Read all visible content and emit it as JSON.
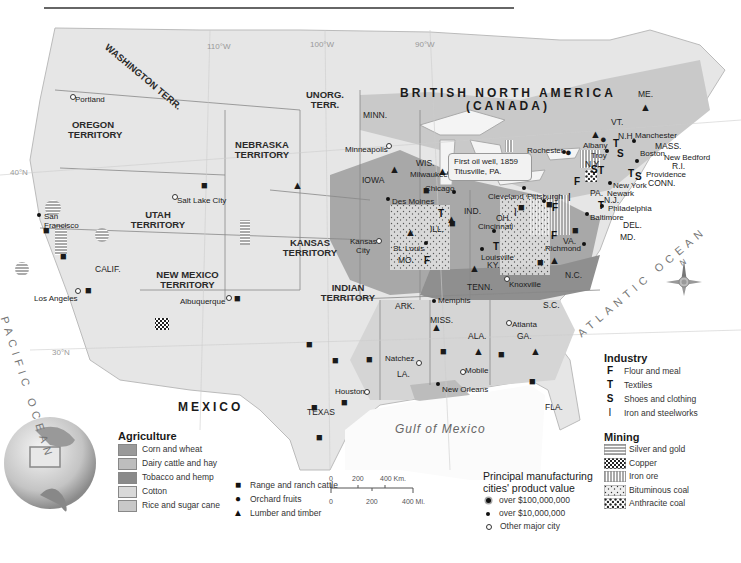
{
  "map": {
    "countries": {
      "canada_line1": "BRITISH NORTH AMERICA",
      "canada_line2": "(CANADA)",
      "mexico": "MEXICO"
    },
    "oceans": {
      "pacific": "PACIFIC OCEAN",
      "atlantic": "ATLANTIC OCEAN",
      "gulf": "Gulf of Mexico"
    },
    "graticule": {
      "lon_110": "110°W",
      "lon_100": "100°W",
      "lon_90": "90°W",
      "lat_40": "40°N",
      "lat_30": "30°N"
    },
    "territories": {
      "washington": "WASHINGTON TERR.",
      "oregon": "OREGON TERRITORY",
      "utah": "UTAH TERRITORY",
      "new_mexico": "NEW MEXICO TERRITORY",
      "nebraska": "NEBRASKA TERRITORY",
      "kansas": "KANSAS TERRITORY",
      "indian": "INDIAN TERRITORY",
      "unorg": "UNORG. TERR."
    },
    "states": {
      "calif": "CALIF.",
      "texas": "TEXAS",
      "minn": "MINN.",
      "iowa": "IOWA",
      "wis": "WIS.",
      "mich": "MICH.",
      "ill": "ILL.",
      "ind": "IND.",
      "oh": "OH.",
      "mo": "MO.",
      "ky": "KY.",
      "tenn": "TENN.",
      "ark": "ARK.",
      "la": "LA.",
      "miss": "MISS.",
      "ala": "ALA.",
      "ga": "GA.",
      "fla": "FLA.",
      "sc": "S.C.",
      "nc": "N.C.",
      "va": "VA.",
      "pa": "PA.",
      "ny": "N.Y.",
      "nj": "N.J.",
      "del": "DEL.",
      "md": "MD.",
      "conn": "CONN.",
      "ri": "R.I.",
      "mass": "MASS.",
      "nh": "N.H.",
      "vt": "VT.",
      "me": "ME."
    },
    "cities": {
      "portland": "Portland",
      "san_francisco": "San Francisco",
      "los_angeles": "Los Angeles",
      "salt_lake_city": "Salt Lake City",
      "albuquerque": "Albuquerque",
      "minneapolis": "Minneapolis",
      "milwaukee": "Milwaukee",
      "chicago": "Chicago",
      "des_moines": "Des Moines",
      "kansas_city": "Kansas City",
      "st_louis": "St. Louis",
      "detroit": "Detroit",
      "cleveland": "Cleveland",
      "pittsburgh": "Pittsburgh",
      "cincinnati": "Cincinnati",
      "louisville": "Louisville",
      "knoxville": "Knoxville",
      "memphis": "Memphis",
      "atlanta": "Atlanta",
      "natchez": "Natchez",
      "mobile": "Mobile",
      "new_orleans": "New Orleans",
      "houston": "Houston",
      "rochester": "Rochester",
      "albany": "Albany",
      "troy": "Troy",
      "manchester": "Manchester",
      "boston": "Boston",
      "new_bedford": "New Bedford",
      "providence": "Providence",
      "new_york": "New York",
      "newark": "Newark",
      "philadelphia": "Philadelphia",
      "baltimore": "Baltimore",
      "richmond": "Richmond"
    },
    "callout": {
      "line1": "First oil well, 1859",
      "line2": "Titusville, PA."
    },
    "compass": "N"
  },
  "legend": {
    "agriculture": {
      "title": "Agriculture",
      "items": [
        {
          "label": "Corn and wheat",
          "color": "#9a9a9a"
        },
        {
          "label": "Dairy cattle and hay",
          "color": "#bdbdbd"
        },
        {
          "label": "Tobacco and hemp",
          "color": "#8a8a8a"
        },
        {
          "label": "Cotton",
          "color": "#d9d9d9"
        },
        {
          "label": "Rice and sugar cane",
          "color": "#c8c8c8"
        }
      ],
      "symbols": [
        {
          "icon": "cattle-icon",
          "label": "Range and ranch cattle"
        },
        {
          "icon": "orchard-icon",
          "label": "Orchard fruits"
        },
        {
          "icon": "tree-icon",
          "label": "Lumber and timber"
        }
      ]
    },
    "scale": {
      "km": [
        "0",
        "200",
        "400 Km."
      ],
      "mi": [
        "0",
        "200",
        "400 Mi."
      ]
    },
    "manufacturing": {
      "title_line1": "Principal manufacturing",
      "title_line2": "cities' product value",
      "items": [
        {
          "symbol": "large-dot",
          "label": "over $100,000,000"
        },
        {
          "symbol": "dot",
          "label": "over $10,000,000"
        },
        {
          "symbol": "open-dot",
          "label": "Other major city"
        }
      ]
    },
    "industry": {
      "title": "Industry",
      "items": [
        {
          "glyph": "F",
          "label": "Flour and meal"
        },
        {
          "glyph": "T",
          "label": "Textiles"
        },
        {
          "glyph": "S",
          "label": "Shoes and clothing"
        },
        {
          "glyph": "I",
          "label": "Iron and steelworks"
        }
      ]
    },
    "mining": {
      "title": "Mining",
      "items": [
        {
          "pattern": "horizontal-lines",
          "label": "Silver and gold"
        },
        {
          "pattern": "checker",
          "label": "Copper"
        },
        {
          "pattern": "vertical-lines",
          "label": "Iron ore"
        },
        {
          "pattern": "dots",
          "label": "Bituminous coal"
        },
        {
          "pattern": "checker-dots",
          "label": "Anthracite coal"
        }
      ]
    }
  }
}
